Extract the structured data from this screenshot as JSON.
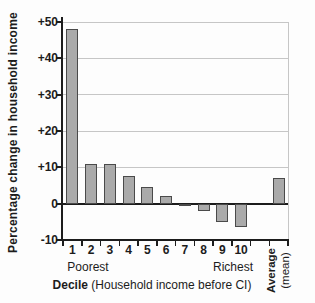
{
  "chart_data": {
    "type": "bar",
    "title": "",
    "ylabel": "Percentage change in household income",
    "xlabel": {
      "bold": "Decile",
      "rest": " (Household income before CI)"
    },
    "categories": [
      "1",
      "2",
      "3",
      "4",
      "5",
      "6",
      "7",
      "8",
      "9",
      "10",
      "",
      "Average"
    ],
    "values": [
      48,
      11,
      11,
      7.5,
      4.5,
      2,
      -0.5,
      -2,
      -5,
      -6.5,
      null,
      7
    ],
    "ylim": [
      -10,
      50
    ],
    "yticks": [
      {
        "value": 50,
        "label": "+50"
      },
      {
        "value": 40,
        "label": "+40"
      },
      {
        "value": 30,
        "label": "+30"
      },
      {
        "value": 20,
        "label": "+20"
      },
      {
        "value": 10,
        "label": "+10"
      },
      {
        "value": 0,
        "label": "0"
      },
      {
        "value": -10,
        "label": "-10"
      }
    ],
    "grid": true,
    "legend_position": "none",
    "annotations": {
      "poorest": "Poorest",
      "richest": "Richest",
      "average_line1": "Average",
      "average_line2": "(mean)"
    },
    "colors": {
      "bar_fill": "#aaaaaa",
      "bar_border": "#4a4a4a",
      "grid": "#c6c6c6",
      "axis": "#1c1c1c",
      "text": "#1c1c1c",
      "background": "#fdfdfd"
    }
  }
}
